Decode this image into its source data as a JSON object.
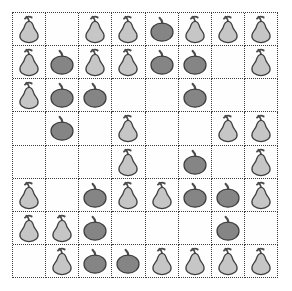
{
  "scene": {
    "type": "fruit-grid-puzzle",
    "rows": 8,
    "columns": 8,
    "cell_size_px": 33,
    "grid_origin_px": [
      12,
      12
    ],
    "border_style": "dotted",
    "background_color": "#ffffff",
    "grid_line_color": "#3a3a3a"
  },
  "legend": {
    "pear": {
      "label": "pear",
      "body_color": "#c6c6c6",
      "outline_color": "#3f3f3f",
      "stem_color": "#4a4a4a",
      "count": 33
    },
    "apple": {
      "label": "apple",
      "body_color": "#858585",
      "outline_color": "#3f3f3f",
      "stem_color": "#4a4a4a",
      "count": 17
    },
    "empty": {
      "label": "empty",
      "body_color": "#fefefe",
      "count": 14
    }
  },
  "grid": {
    "cells": [
      [
        "pear",
        "empty",
        "pear",
        "pear",
        "apple",
        "pear",
        "pear",
        "pear"
      ],
      [
        "pear",
        "apple",
        "pear",
        "pear",
        "apple",
        "apple",
        "empty",
        "pear"
      ],
      [
        "pear",
        "apple",
        "apple",
        "empty",
        "empty",
        "apple",
        "empty",
        "empty"
      ],
      [
        "empty",
        "apple",
        "empty",
        "pear",
        "empty",
        "empty",
        "pear",
        "pear"
      ],
      [
        "empty",
        "empty",
        "empty",
        "pear",
        "empty",
        "apple",
        "empty",
        "pear"
      ],
      [
        "pear",
        "empty",
        "apple",
        "pear",
        "pear",
        "apple",
        "apple",
        "pear"
      ],
      [
        "pear",
        "pear",
        "apple",
        "empty",
        "empty",
        "empty",
        "apple",
        "empty"
      ],
      [
        "empty",
        "pear",
        "apple",
        "apple",
        "pear",
        "pear",
        "pear",
        "pear"
      ]
    ]
  }
}
